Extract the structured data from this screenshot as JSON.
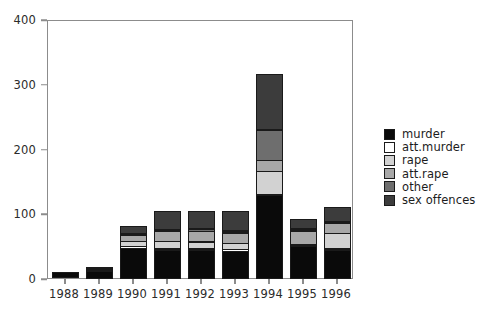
{
  "chart_data": {
    "type": "bar",
    "subtype": "stacked",
    "title": "",
    "xlabel": "",
    "ylabel": "",
    "categories": [
      "1988",
      "1989",
      "1990",
      "1991",
      "1992",
      "1993",
      "1994",
      "1995",
      "1996"
    ],
    "series": [
      {
        "name": "murder",
        "color": "#0a0a0a",
        "values": [
          10,
          12,
          48,
          45,
          44,
          43,
          130,
          50,
          45
        ]
      },
      {
        "name": "att.murder",
        "color": "#ffffff",
        "values": [
          0,
          3,
          4,
          4,
          4,
          4,
          0,
          3,
          4
        ]
      },
      {
        "name": "rape",
        "color": "#d2d2d2",
        "values": [
          0,
          3,
          9,
          12,
          12,
          11,
          38,
          3,
          24
        ]
      },
      {
        "name": "att.rape",
        "color": "#a8a8a8",
        "values": [
          0,
          2,
          10,
          16,
          18,
          17,
          18,
          22,
          17
        ]
      },
      {
        "name": "other",
        "color": "#6e6e6e",
        "values": [
          0,
          0,
          2,
          4,
          4,
          4,
          47,
          4,
          2
        ]
      },
      {
        "name": "sex offences",
        "color": "#3c3c3c",
        "values": [
          0,
          0,
          12,
          29,
          28,
          31,
          87,
          15,
          23
        ]
      }
    ],
    "totals": [
      10,
      20,
      85,
      110,
      110,
      110,
      320,
      97,
      115
    ],
    "yticks": [
      0,
      100,
      200,
      300,
      400
    ],
    "ylim": [
      0,
      400
    ],
    "xlim_categories": 9,
    "grid": false,
    "legend_position": "right",
    "legend_entries": [
      "murder",
      "att.murder",
      "rape",
      "att.rape",
      "other",
      "sex offences"
    ],
    "frame": "box",
    "bar_edge_color": "#1a1a1a",
    "axis_color": "#8c8c8c",
    "background": "#ffffff"
  }
}
